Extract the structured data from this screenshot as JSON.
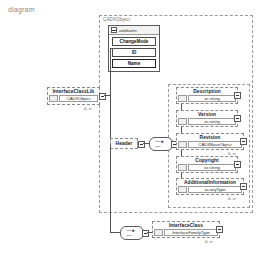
{
  "page": {
    "caption": "diagram"
  },
  "groups": [
    {
      "title": "CADXObject"
    }
  ],
  "root_element": {
    "name": "InterfaceClassLib",
    "type": "CADXObject",
    "cardinality": "0..∞",
    "type_icon": "type-icon"
  },
  "attributes_panel": {
    "header": "attributes",
    "toggle_icon": "collapse-icon",
    "rows": [
      {
        "label": "ChangeMode"
      },
      {
        "label": "ID"
      },
      {
        "label": "Name"
      }
    ]
  },
  "sequence": {
    "header_element": {
      "name": "Header",
      "expand_icon": "expand-icon"
    },
    "compositor_icon": "sequence-compositor-icon",
    "children": [
      {
        "name": "Description",
        "type": "xs:string",
        "cardinality": "",
        "type_icon": "type-icon",
        "dashed": true
      },
      {
        "name": "Version",
        "type": "xs:string",
        "cardinality": "",
        "type_icon": "type-icon",
        "dashed": true
      },
      {
        "name": "Revision",
        "type": "CADXBaseObject",
        "cardinality": "0..∞",
        "type_icon": "type-icon",
        "dashed": true
      },
      {
        "name": "Copyright",
        "type": "xs:string",
        "cardinality": "",
        "type_icon": "type-icon",
        "dashed": true
      },
      {
        "name": "AdditionalInformation",
        "type": "xs:anyType",
        "cardinality": "0..∞",
        "type_icon": "type-icon",
        "dashed": true
      }
    ]
  },
  "bottom": {
    "compositor_icon": "sequence-compositor-icon",
    "element": {
      "name": "InterfaceClass",
      "type": "InterfaceFamilyType",
      "cardinality": "0..∞",
      "type_icon": "type-icon",
      "dashed": true
    }
  },
  "colors": {
    "line": "#555555",
    "border": "#6d6d6d",
    "group": "#9a9a9a",
    "caption": "#8b8b8b"
  }
}
